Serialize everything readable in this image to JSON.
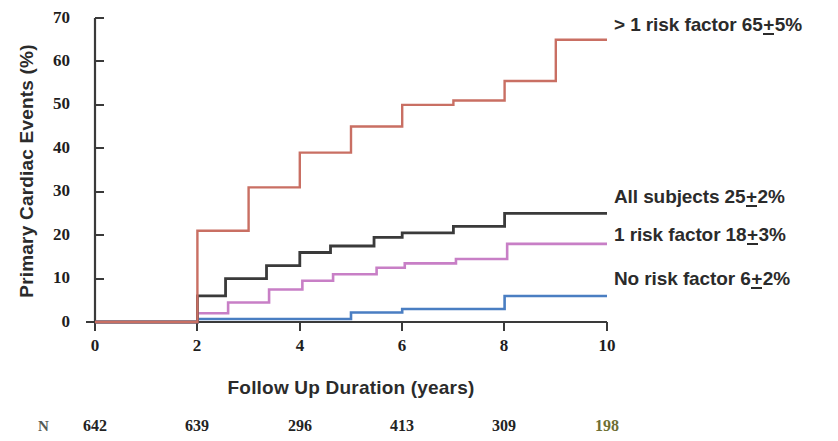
{
  "chart_data": {
    "type": "line",
    "subtype": "kaplan-meier-step",
    "title": "",
    "xlabel": "Follow Up Duration (years)",
    "ylabel": "Primary Cardiac Events (%)",
    "xlim": [
      0,
      10
    ],
    "ylim": [
      0,
      70
    ],
    "xticks": [
      0,
      2,
      4,
      6,
      8,
      10
    ],
    "yticks": [
      0,
      10,
      20,
      30,
      40,
      50,
      60,
      70
    ],
    "grid": false,
    "legend_position": "right-inline-annotations",
    "series": [
      {
        "name": "> 1 risk factor",
        "label": "> 1 risk factor 65+5%",
        "final_value": 65,
        "error": 5,
        "color": "#c96f63",
        "x": [
          0,
          2,
          2,
          3,
          3,
          4,
          4,
          5,
          5,
          6,
          6,
          7,
          7,
          8,
          8,
          9,
          9,
          10
        ],
        "y": [
          0,
          0,
          21,
          21,
          31,
          31,
          39,
          39,
          45,
          45,
          50,
          50,
          51,
          51,
          55.5,
          55.5,
          65,
          65
        ]
      },
      {
        "name": "All subjects",
        "label": "All subjects 25+2%",
        "final_value": 25,
        "error": 2,
        "color": "#3a3a3a",
        "x": [
          0,
          2,
          2,
          2.55,
          2.55,
          3.35,
          3.35,
          4,
          4,
          4.6,
          4.6,
          5.45,
          5.45,
          6,
          6,
          7,
          7,
          8,
          8,
          8.55,
          8.55,
          10
        ],
        "y": [
          0,
          0,
          6,
          6,
          10,
          10,
          13,
          13,
          16,
          16,
          17.5,
          17.5,
          19.5,
          19.5,
          20.5,
          20.5,
          22,
          22,
          25,
          25,
          25,
          25
        ]
      },
      {
        "name": "1 risk factor",
        "label": "1 risk factor 18+3%",
        "final_value": 18,
        "error": 3,
        "color": "#c87fc6",
        "x": [
          0,
          2,
          2,
          2.6,
          2.6,
          3.4,
          3.4,
          4.05,
          4.05,
          4.65,
          4.65,
          5.5,
          5.5,
          6.05,
          6.05,
          7.05,
          7.05,
          8.05,
          8.05,
          8.6,
          8.6,
          10
        ],
        "y": [
          0,
          0,
          2,
          2,
          4.5,
          4.5,
          7.5,
          7.5,
          9.5,
          9.5,
          11,
          11,
          12.5,
          12.5,
          13.5,
          13.5,
          14.5,
          14.5,
          18,
          18,
          18,
          18
        ]
      },
      {
        "name": "No risk factor",
        "label": "No risk factor 6+2%",
        "final_value": 6,
        "error": 2,
        "color": "#4a7ec2",
        "x": [
          0,
          2,
          2,
          5,
          5,
          6,
          6,
          8,
          8,
          10
        ],
        "y": [
          0,
          0,
          0.7,
          0.7,
          2.2,
          2.2,
          3,
          3,
          6,
          6
        ]
      }
    ],
    "at_risk": {
      "row_label": "N",
      "x_positions": [
        0,
        2,
        4,
        6,
        8,
        10
      ],
      "values": [
        642,
        639,
        296,
        413,
        309,
        198
      ]
    }
  },
  "axes": {
    "y_title": "Primary Cardiac Events (%)",
    "x_title": "Follow Up Duration (years)",
    "y_ticks": [
      "70",
      "60",
      "50",
      "40",
      "30",
      "20",
      "10",
      "0"
    ],
    "x_ticks": [
      "0",
      "2",
      "4",
      "6",
      "8",
      "10"
    ]
  },
  "annotations": {
    "risk_gt1": {
      "prefix": "> 1 risk factor 65",
      "pm": "+",
      "suffix": "5%"
    },
    "all_subjects": {
      "prefix": "All subjects 25",
      "pm": "+",
      "suffix": "2%"
    },
    "risk_1": {
      "prefix": "1 risk factor 18",
      "pm": "+",
      "suffix": "3%"
    },
    "risk_0": {
      "prefix": "No risk factor 6",
      "pm": "+",
      "suffix": "2%"
    }
  },
  "at_risk_row": {
    "label": "N",
    "values": [
      "642",
      "639",
      "296",
      "413",
      "309",
      "198"
    ]
  },
  "colors": {
    "gt1_risk": "#c96f63",
    "all_subjects": "#3a3a3a",
    "one_risk": "#c87fc6",
    "no_risk": "#4a7ec2",
    "axis": "#3a3a3a",
    "text": "#2b2b2b"
  }
}
